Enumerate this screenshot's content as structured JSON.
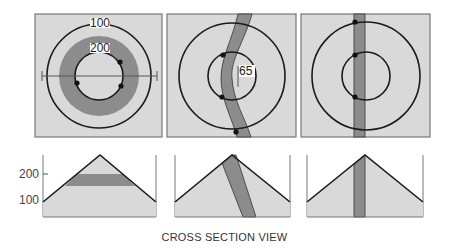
{
  "diagram": {
    "caption": "CROSS SECTION VIEW",
    "colors": {
      "panel_fill": "#d9d9d9",
      "panel_border": "#777777",
      "band_fill": "#8c8c8c",
      "line": "#1a1a1a",
      "label_bg": "#ffffff"
    },
    "map_views": [
      {
        "id": "horizontal-layer",
        "contour_labels": [
          "100",
          "200"
        ],
        "description": "Horizontal rock layer forms a ring between contours"
      },
      {
        "id": "dipping-layer",
        "contour_labels": [
          "65"
        ],
        "description": "Dipping layer crosses contours as a curved band"
      },
      {
        "id": "vertical-layer",
        "contour_labels": [],
        "description": "Vertical layer appears as a straight band"
      }
    ],
    "cross_sections": [
      {
        "id": "horizontal-layer-section",
        "axis_labels": [
          "200",
          "100"
        ]
      },
      {
        "id": "dipping-layer-section",
        "axis_labels": []
      },
      {
        "id": "vertical-layer-section",
        "axis_labels": []
      }
    ]
  }
}
